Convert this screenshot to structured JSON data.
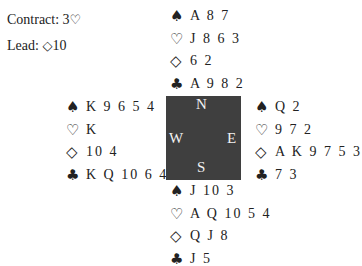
{
  "info": {
    "contract_label": "Contract: 3",
    "contract_suit": "♡",
    "lead_label": "Lead: ",
    "lead_suit": "◇",
    "lead_card": "10"
  },
  "compass": {
    "north": "N",
    "south": "S",
    "east": "E",
    "west": "W",
    "color": "#3f3f3f"
  },
  "suits": {
    "spades": "♠",
    "hearts": "♡",
    "diamonds": "◇",
    "clubs": "♣"
  },
  "hands": {
    "north": {
      "spades": "A 8 7",
      "hearts": "J 8 6 3",
      "diamonds": "6 2",
      "clubs": "A 9 8 2"
    },
    "west": {
      "spades": "K 9 6 5 4",
      "hearts": "K",
      "diamonds": "10 4",
      "clubs": "K Q 10 6 4"
    },
    "east": {
      "spades": "Q 2",
      "hearts": "9 7 2",
      "diamonds": "A K 9 7 5 3",
      "clubs": "7 3"
    },
    "south": {
      "spades": "J 10 3",
      "hearts": "A Q 10 5 4",
      "diamonds": "Q J 8",
      "clubs": "J 5"
    }
  }
}
